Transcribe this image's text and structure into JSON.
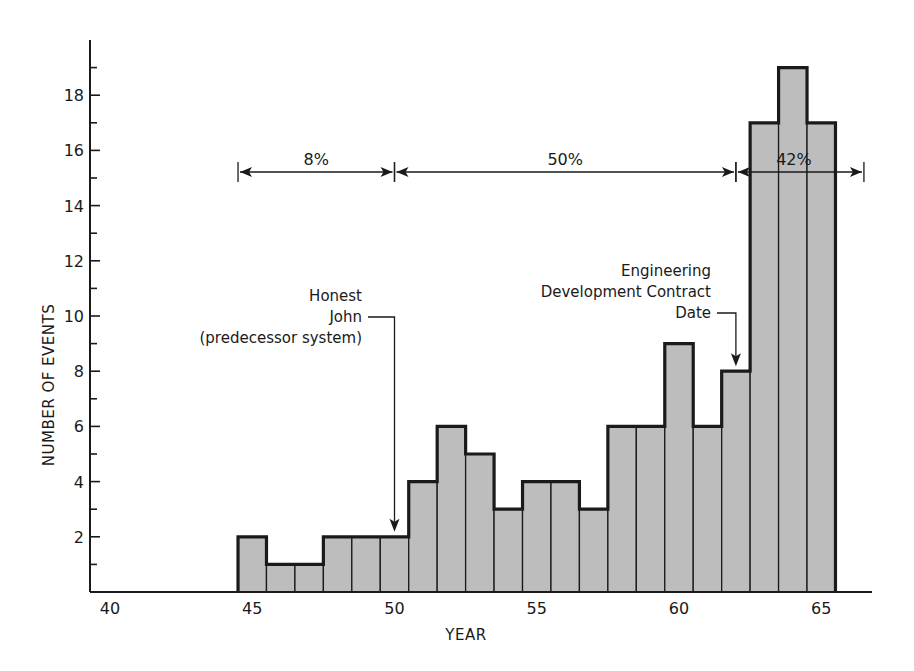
{
  "chart_data": {
    "type": "bar",
    "title": "",
    "xlabel": "YEAR",
    "ylabel": "NUMBER OF EVENTS",
    "x": [
      45,
      46,
      47,
      48,
      49,
      50,
      51,
      52,
      53,
      54,
      55,
      56,
      57,
      58,
      59,
      60,
      61,
      62,
      63,
      64,
      65
    ],
    "values": [
      2,
      1,
      1,
      2,
      2,
      2,
      4,
      6,
      5,
      3,
      4,
      4,
      3,
      6,
      6,
      9,
      6,
      8,
      17,
      19,
      17
    ],
    "xlim": [
      39.5,
      66.5
    ],
    "ylim": [
      0,
      20
    ],
    "x_ticks": [
      40,
      45,
      50,
      55,
      60,
      65
    ],
    "y_ticks": [
      2,
      4,
      6,
      8,
      10,
      12,
      14,
      16,
      18
    ],
    "y_minor_ticks": [
      1,
      3,
      5,
      7,
      9,
      11,
      13,
      15,
      17,
      19
    ],
    "grid": false,
    "legend": null,
    "bar_fill": "#bdbdbd",
    "bar_edge": "#1a1a1a",
    "annotations": [
      {
        "type": "span",
        "label": "8%",
        "x_start": 44.5,
        "x_end": 50.0,
        "y": 15
      },
      {
        "type": "span",
        "label": "50%",
        "x_start": 50.0,
        "x_end": 62.0,
        "y": 15
      },
      {
        "type": "span",
        "label": "42%",
        "x_start": 62.0,
        "x_end": 66.5,
        "y": 15
      },
      {
        "type": "arrow",
        "lines": [
          "Honest",
          "John",
          "(predecessor system)"
        ],
        "x": 50.0,
        "y_target": 2
      },
      {
        "type": "arrow",
        "lines": [
          "Engineering",
          "Development Contract",
          "Date"
        ],
        "x": 62.0,
        "y_target": 8
      }
    ]
  },
  "labels": {
    "x_axis_title": "YEAR",
    "y_axis_title": "NUMBER OF EVENTS",
    "span_8": "8%",
    "span_50": "50%",
    "span_42": "42%",
    "honest_john": [
      "Honest",
      "John",
      "(predecessor system)"
    ],
    "eng_contract": [
      "Engineering",
      "Development Contract",
      "Date"
    ]
  }
}
